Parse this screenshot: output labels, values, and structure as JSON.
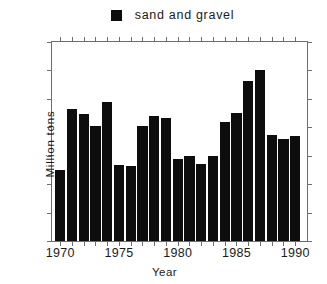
{
  "chart_data": {
    "type": "bar",
    "title": "",
    "xlabel": "Year",
    "ylabel": "Million tons",
    "legend": [
      "sand and gravel"
    ],
    "legend_position": "top-center",
    "grid": false,
    "bar_color": "#0d0d0d",
    "axis_color": "#6e6e6e",
    "xlim": [
      1969.3,
      1991.0
    ],
    "ylim": [
      0,
      35
    ],
    "yticks": [
      0,
      5,
      10,
      15,
      20,
      25,
      30,
      35
    ],
    "xticks": [
      1970,
      1975,
      1980,
      1985,
      1990
    ],
    "xtick_labels": [
      "1970",
      "1975",
      "1980",
      "1985",
      "1990"
    ],
    "ytick_labels": [
      "0",
      "5",
      "10",
      "15",
      "20",
      "25",
      "30",
      "35"
    ],
    "x_minor_tick_interval": 1,
    "y_minor_tick_interval": 5,
    "categories": [
      "1970",
      "1971",
      "1972",
      "1973",
      "1974",
      "1975",
      "1976",
      "1977",
      "1978",
      "1979",
      "1980",
      "1981",
      "1982",
      "1983",
      "1984",
      "1985",
      "1986",
      "1987",
      "1988",
      "1989",
      "1990"
    ],
    "values": [
      12.5,
      23.2,
      22.4,
      20.2,
      24.4,
      13.3,
      13.2,
      20.2,
      21.9,
      21.7,
      14.4,
      14.9,
      13.6,
      14.9,
      21.0,
      22.5,
      28.2,
      30.0,
      18.7,
      17.9,
      18.5
    ],
    "series": [
      {
        "name": "sand and gravel",
        "values": [
          12.5,
          23.2,
          22.4,
          20.2,
          24.4,
          13.3,
          13.2,
          20.2,
          21.9,
          21.7,
          14.4,
          14.9,
          13.6,
          14.9,
          21.0,
          22.5,
          28.2,
          30.0,
          18.7,
          17.9,
          18.5
        ]
      }
    ]
  },
  "legend": {
    "label": "sand and gravel",
    "marker": "filled-square"
  },
  "axes": {
    "y_title": "Million tons",
    "x_title": "Year"
  },
  "caption": {
    "text": ""
  }
}
